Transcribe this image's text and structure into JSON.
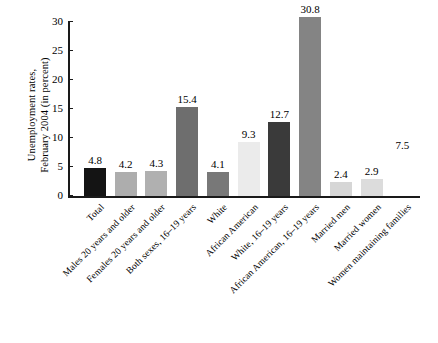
{
  "chart_data": {
    "type": "bar",
    "title": "",
    "xlabel": "",
    "ylabel": "Unemployment rates, February 2004 (in percent)",
    "ylabel_lines": [
      "Unemployment rates,",
      "February 2004 (in percent)"
    ],
    "ylim": [
      0,
      30
    ],
    "yticks": [
      0,
      5,
      10,
      15,
      20,
      25,
      30
    ],
    "ytick_labels": [
      "0",
      "5",
      "10",
      "15",
      "20",
      "25",
      "30"
    ],
    "grid": false,
    "legend": "none",
    "categories": [
      "Total",
      "Males 20 years and older",
      "Females 20 years and older",
      "Both sexes, 16–19 years",
      "White",
      "African American",
      "White, 16–19 years",
      "African American, 16–19 years",
      "Married men",
      "Married women",
      "Women maintaining families"
    ],
    "values": [
      4.8,
      4.2,
      4.3,
      15.4,
      4.1,
      9.3,
      12.7,
      30.8,
      2.4,
      2.9,
      7.5
    ],
    "value_labels": [
      "4.8",
      "4.2",
      "4.3",
      "15.4",
      "4.1",
      "9.3",
      "12.7",
      "30.8",
      "2.4",
      "2.9",
      "7.5"
    ],
    "bar_colors": [
      "#141414",
      "#adadad",
      "#b0b0b0",
      "#6e6e6e",
      "#787878",
      "#ebebeb",
      "#3a3a3a",
      "#848484",
      "#d6d6d6",
      "#dcdcdc",
      "#ffffff"
    ],
    "bars_rendered": [
      true,
      true,
      true,
      true,
      true,
      true,
      true,
      true,
      true,
      true,
      false
    ]
  },
  "colors": {
    "axis": "#1a1a1a",
    "background": "#ffffff",
    "text": "#000000"
  }
}
